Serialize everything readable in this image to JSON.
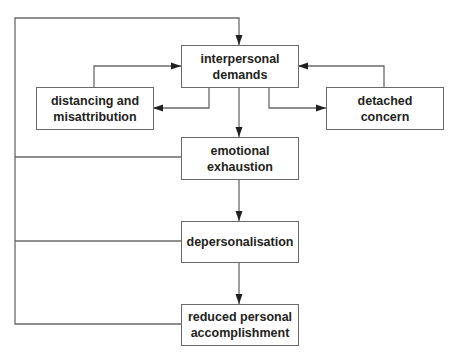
{
  "diagram": {
    "type": "flowchart",
    "colors": {
      "line": "#6a6a6a",
      "text": "#231f20",
      "arrowhead": "#231f20",
      "background": "#ffffff"
    },
    "nodes": [
      {
        "id": "interpersonal",
        "lines": [
          "interpersonal",
          "demands"
        ]
      },
      {
        "id": "distancing",
        "lines": [
          "distancing and",
          "misattribution"
        ]
      },
      {
        "id": "detached",
        "lines": [
          "detached",
          "concern"
        ]
      },
      {
        "id": "emotional",
        "lines": [
          "emotional",
          "exhaustion"
        ]
      },
      {
        "id": "depersonalisation",
        "lines": [
          "depersonalisation"
        ]
      },
      {
        "id": "reduced",
        "lines": [
          "reduced personal",
          "accomplishment"
        ]
      }
    ],
    "edges": [
      {
        "from": "interpersonal",
        "to": "distancing"
      },
      {
        "from": "distancing",
        "to": "interpersonal"
      },
      {
        "from": "interpersonal",
        "to": "detached"
      },
      {
        "from": "detached",
        "to": "interpersonal"
      },
      {
        "from": "interpersonal",
        "to": "emotional"
      },
      {
        "from": "emotional",
        "to": "depersonalisation"
      },
      {
        "from": "depersonalisation",
        "to": "reduced"
      },
      {
        "from": "emotional",
        "to": "interpersonal",
        "via": "left feedback loop"
      },
      {
        "from": "depersonalisation",
        "to": "interpersonal",
        "via": "left feedback loop"
      },
      {
        "from": "reduced",
        "to": "interpersonal",
        "via": "left feedback loop"
      }
    ]
  }
}
